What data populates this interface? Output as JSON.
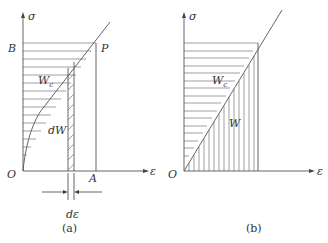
{
  "panel_a": {
    "caption": "(a)",
    "labels": {
      "y_axis": "σ",
      "x_axis": "ε",
      "origin": "O",
      "point_b": "B",
      "point_p": "P",
      "point_a": "A",
      "complementary_energy": "W",
      "complementary_subscript": "c",
      "strip_energy": "dW",
      "strip_width": "dε"
    }
  },
  "panel_b": {
    "caption": "(b)",
    "labels": {
      "y_axis": "σ",
      "x_axis": "ε",
      "origin": "O",
      "complementary_energy": "W",
      "complementary_subscript": "c",
      "strain_energy": "W"
    }
  }
}
